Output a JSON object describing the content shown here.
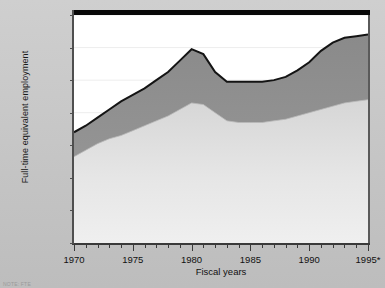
{
  "chart_data": {
    "type": "area",
    "title": "",
    "xlabel": "Fiscal years",
    "ylabel": "Full-time equivalent employment",
    "xlim": [
      1970,
      1995
    ],
    "ylim": [
      0,
      140000
    ],
    "ytick_labels": [
      "0",
      "20,000",
      "40,000",
      "60,000",
      "80,000",
      "100,000",
      "120,000",
      "140,000"
    ],
    "ytick_values": [
      0,
      20000,
      40000,
      60000,
      80000,
      100000,
      120000,
      140000
    ],
    "xtick_labels": [
      "1970",
      "1975",
      "1980",
      "1985",
      "1990",
      "1995*"
    ],
    "xtick_values": [
      1970,
      1975,
      1980,
      1985,
      1990,
      1995
    ],
    "grid": true,
    "legend": "none",
    "stacked": true,
    "x": [
      1970,
      1971,
      1972,
      1973,
      1974,
      1975,
      1976,
      1977,
      1978,
      1979,
      1980,
      1981,
      1982,
      1983,
      1984,
      1985,
      1986,
      1987,
      1988,
      1989,
      1990,
      1991,
      1992,
      1993,
      1994,
      1995
    ],
    "series": [
      {
        "name": "lower-band",
        "color": "#e2e2e2",
        "values": [
          53000,
          57000,
          61000,
          64000,
          66000,
          69000,
          72000,
          75000,
          78000,
          82000,
          86000,
          85000,
          80000,
          75000,
          74000,
          74000,
          74000,
          75000,
          76000,
          78000,
          80000,
          82000,
          84000,
          86000,
          87000,
          88000
        ]
      },
      {
        "name": "upper-band",
        "color": "#8f8f8f",
        "values": [
          15000,
          15000,
          16000,
          18000,
          21000,
          22000,
          23000,
          25000,
          27000,
          30000,
          33000,
          31000,
          25000,
          24000,
          25000,
          25000,
          25000,
          25000,
          26000,
          28000,
          31000,
          36000,
          39000,
          40000,
          40000,
          40000
        ]
      }
    ],
    "totals": [
      68000,
      72000,
      77000,
      82000,
      87000,
      91000,
      95000,
      100000,
      105000,
      112000,
      119000,
      116000,
      105000,
      99000,
      99000,
      99000,
      99000,
      100000,
      102000,
      106000,
      111000,
      118000,
      123000,
      126000,
      127000,
      128000
    ]
  },
  "footnote": "NOTE:  FTE"
}
